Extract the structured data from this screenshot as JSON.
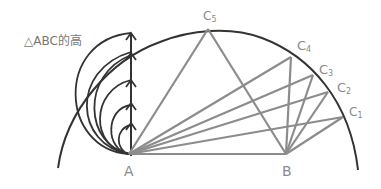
{
  "title": "△ABC的高",
  "colors": {
    "dark_stroke": "#333333",
    "gray_stroke": "#8c8c8c",
    "label": "#8a8a8a",
    "background": "#ffffff"
  },
  "points": {
    "A": {
      "label": "A",
      "x": 129,
      "y": 154
    },
    "B": {
      "label": "B",
      "x": 286,
      "y": 154
    },
    "C1": {
      "label": "C",
      "sub": "1",
      "x": 343,
      "y": 117
    },
    "C2": {
      "label": "C",
      "sub": "2",
      "x": 328,
      "y": 92
    },
    "C3": {
      "label": "C",
      "sub": "3",
      "x": 313,
      "y": 75
    },
    "C4": {
      "label": "C",
      "sub": "4",
      "x": 291,
      "y": 57
    },
    "C5": {
      "label": "C",
      "sub": "5",
      "x": 208,
      "y": 29
    }
  },
  "labels": {
    "A": "A",
    "B": "B",
    "C": "C",
    "C1_sub": "1",
    "C2_sub": "2",
    "C3_sub": "3",
    "C4_sub": "4",
    "C5_sub": "5"
  }
}
